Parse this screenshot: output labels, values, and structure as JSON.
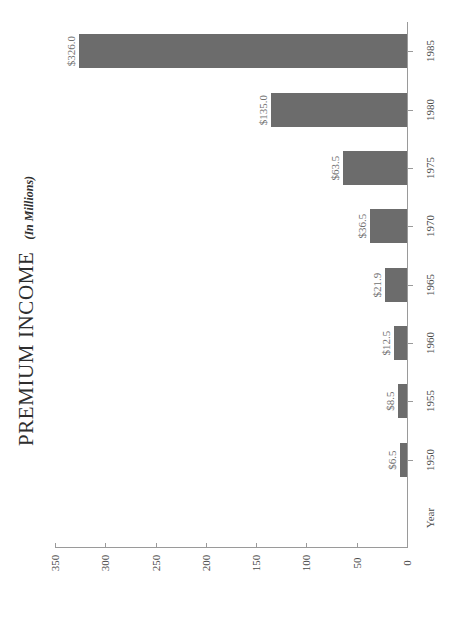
{
  "chart_data": {
    "type": "bar",
    "orientation": "horizontal",
    "title": "PREMIUM INCOME",
    "subtitle": "(In Millions)",
    "xlabel": "Year",
    "ylabel": "",
    "categories": [
      "1950",
      "1955",
      "1960",
      "1965",
      "1970",
      "1975",
      "1980",
      "1985"
    ],
    "values": [
      6.5,
      8.5,
      12.5,
      21.9,
      36.5,
      63.5,
      135.0,
      326.0
    ],
    "data_labels": [
      "$6.5",
      "$8.5",
      "$12.5",
      "$21.9",
      "$36.5",
      "$63.5",
      "$135.0",
      "$326.0"
    ],
    "value_ticks": [
      "350",
      "300",
      "250",
      "200",
      "150",
      "100",
      "50",
      "0"
    ],
    "value_tick_numbers": [
      350,
      300,
      250,
      200,
      150,
      100,
      50,
      0
    ],
    "ylim": [
      0,
      350
    ],
    "value_axis_reversed": true,
    "grid": false,
    "legend": false,
    "rotated_layout_degrees": -90,
    "colors": {
      "bar_fill": "#6c6c6c",
      "axis_line": "#9a9a9a",
      "label_text": "#6f6f6f",
      "tick_text": "#4a4a4a",
      "title_text": "#2e2e2e",
      "background": "#ffffff"
    }
  }
}
